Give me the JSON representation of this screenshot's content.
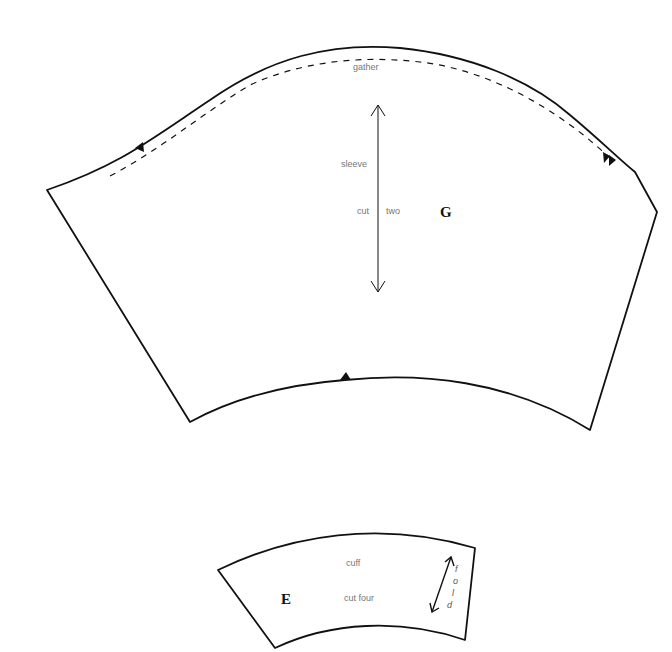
{
  "colors": {
    "outline": "#111111",
    "label": "#777777",
    "background": "#ffffff"
  },
  "piece_g": {
    "letter": "G",
    "gather_label": "gather",
    "name_label": "sleeve",
    "cut_label": "cut",
    "count_label": "two",
    "grainline": "double-arrow-vertical",
    "notches": [
      "left-single",
      "right-double",
      "bottom-center"
    ]
  },
  "piece_e": {
    "letter": "E",
    "name_label": "cuff",
    "cut_label": "cut four",
    "fold_label": "fold",
    "fold_letters": [
      "f",
      "o",
      "l",
      "d"
    ],
    "grainline": "double-arrow-diagonal"
  }
}
